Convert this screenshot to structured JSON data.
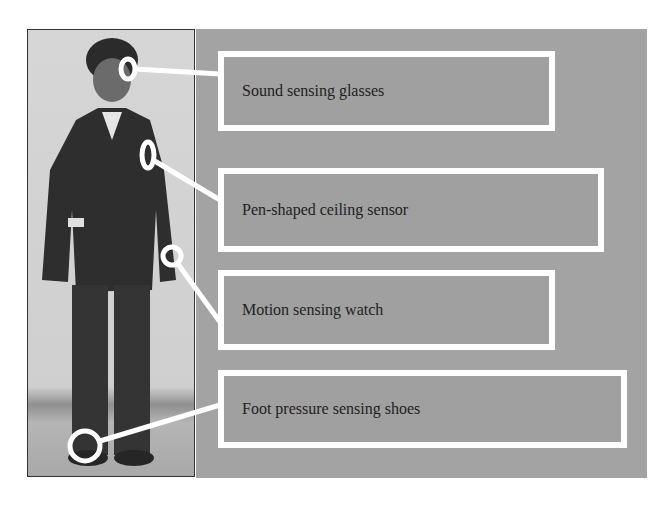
{
  "figure": {
    "photo_description": "Person standing, wearing sensors",
    "labels": [
      {
        "text": "Sound sensing glasses"
      },
      {
        "text": "Pen-shaped ceiling sensor"
      },
      {
        "text": "Motion sensing watch"
      },
      {
        "text": "Foot pressure sensing shoes"
      }
    ],
    "colors": {
      "panel": "#a3a3a3",
      "box_border": "#ffffff",
      "text": "#222222"
    }
  }
}
